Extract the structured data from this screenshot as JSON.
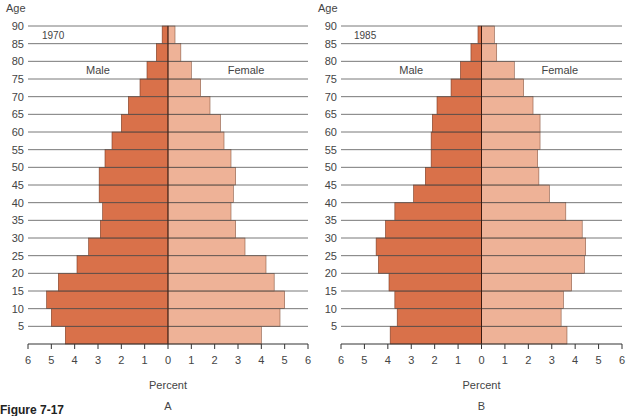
{
  "figure": {
    "caption": "Figure 7-17"
  },
  "colors": {
    "male": "#d9714a",
    "female": "#eeb297",
    "axis": "#333333",
    "grid": "#555555"
  },
  "chart_data": [
    {
      "type": "bar",
      "subtype": "population-pyramid",
      "panel": "A",
      "title": "1970",
      "ylabel": "Age",
      "xlabel": "Percent",
      "left_label": "Male",
      "right_label": "Female",
      "age_ticks": [
        5,
        10,
        15,
        20,
        25,
        30,
        35,
        40,
        45,
        50,
        55,
        60,
        65,
        70,
        75,
        80,
        85,
        90
      ],
      "x_ticks_left": [
        6,
        5,
        4,
        3,
        2,
        1,
        0
      ],
      "x_ticks_right": [
        1,
        2,
        3,
        4,
        5,
        6
      ],
      "xlim": [
        -6,
        6
      ],
      "categories": [
        "0-4",
        "5-9",
        "10-14",
        "15-19",
        "20-24",
        "25-29",
        "30-34",
        "35-39",
        "40-44",
        "45-49",
        "50-54",
        "55-59",
        "60-64",
        "65-69",
        "70-74",
        "75-79",
        "80-84",
        "85-89"
      ],
      "series": [
        {
          "name": "Male",
          "values": [
            4.4,
            5.0,
            5.2,
            4.7,
            3.9,
            3.4,
            2.9,
            2.8,
            2.95,
            2.95,
            2.7,
            2.4,
            2.0,
            1.7,
            1.2,
            0.9,
            0.5,
            0.25
          ]
        },
        {
          "name": "Female",
          "values": [
            4.0,
            4.8,
            5.0,
            4.55,
            4.2,
            3.3,
            2.9,
            2.7,
            2.8,
            2.9,
            2.7,
            2.4,
            2.25,
            1.8,
            1.4,
            1.0,
            0.55,
            0.3
          ]
        }
      ],
      "footer_label": "A",
      "grid": true
    },
    {
      "type": "bar",
      "subtype": "population-pyramid",
      "panel": "B",
      "title": "1985",
      "ylabel": "Age",
      "xlabel": "Percent",
      "left_label": "Male",
      "right_label": "Female",
      "age_ticks": [
        5,
        10,
        15,
        20,
        25,
        30,
        35,
        40,
        45,
        50,
        55,
        60,
        65,
        70,
        75,
        80,
        85,
        90
      ],
      "x_ticks_left": [
        6,
        5,
        4,
        3,
        2,
        1,
        0
      ],
      "x_ticks_right": [
        1,
        2,
        3,
        4,
        5,
        6
      ],
      "xlim": [
        -6,
        6
      ],
      "categories": [
        "0-4",
        "5-9",
        "10-14",
        "15-19",
        "20-24",
        "25-29",
        "30-34",
        "35-39",
        "40-44",
        "45-49",
        "50-54",
        "55-59",
        "60-64",
        "65-69",
        "70-74",
        "75-79",
        "80-84",
        "85-89"
      ],
      "series": [
        {
          "name": "Male",
          "values": [
            3.9,
            3.6,
            3.7,
            3.95,
            4.4,
            4.5,
            4.1,
            3.7,
            2.9,
            2.4,
            2.15,
            2.15,
            2.1,
            1.9,
            1.3,
            0.9,
            0.45,
            0.15
          ]
        },
        {
          "name": "Female",
          "values": [
            3.65,
            3.4,
            3.5,
            3.85,
            4.4,
            4.45,
            4.3,
            3.6,
            2.9,
            2.45,
            2.4,
            2.5,
            2.5,
            2.2,
            1.8,
            1.4,
            0.65,
            0.55
          ]
        }
      ],
      "footer_label": "B",
      "grid": true
    }
  ]
}
